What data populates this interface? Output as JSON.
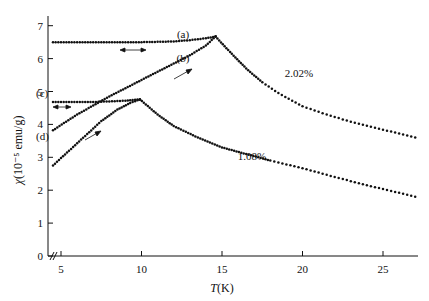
{
  "chart_data": {
    "type": "scatter",
    "title": "",
    "xlabel": "T(K)",
    "ylabel": "χ(10⁻⁵ emu/g)",
    "xlim": [
      4.0,
      27.2
    ],
    "ylim": [
      0,
      7.4
    ],
    "x_ticks": [
      5,
      10,
      15,
      20,
      25
    ],
    "y_ticks": [
      0,
      1,
      2,
      3,
      4,
      5,
      6,
      7
    ],
    "x_axis_break": true,
    "grid": false,
    "legend": "none (inline labels)",
    "series": [
      {
        "name": "(a)",
        "concentration": "2.02%",
        "description": "field-cooled, flat",
        "x": [
          4.5,
          6,
          8,
          10,
          12,
          13,
          14,
          14.6
        ],
        "y": [
          6.5,
          6.5,
          6.5,
          6.5,
          6.52,
          6.56,
          6.62,
          6.67
        ]
      },
      {
        "name": "(b)",
        "concentration": "2.02%",
        "description": "zero-field-cooled, warming",
        "x": [
          4.5,
          6,
          8,
          10,
          12,
          13,
          14,
          14.6
        ],
        "y": [
          3.82,
          4.3,
          4.85,
          5.35,
          5.85,
          6.1,
          6.4,
          6.67
        ]
      },
      {
        "name": "2.02% (above Tf)",
        "x": [
          14.6,
          15.5,
          16.5,
          17.5,
          18.5,
          20,
          21.5,
          23,
          24.5,
          26,
          27
        ],
        "y": [
          6.67,
          6.2,
          5.7,
          5.28,
          4.95,
          4.55,
          4.3,
          4.08,
          3.9,
          3.72,
          3.6
        ]
      },
      {
        "name": "(c)",
        "concentration": "1.08%",
        "description": "field-cooled, flat",
        "x": [
          4.5,
          6,
          7,
          8,
          9,
          9.9
        ],
        "y": [
          4.68,
          4.68,
          4.68,
          4.7,
          4.72,
          4.76
        ]
      },
      {
        "name": "(d)",
        "concentration": "1.08%",
        "description": "zero-field-cooled, warming",
        "x": [
          4.5,
          5.5,
          6.5,
          7.5,
          8.5,
          9.3,
          9.9
        ],
        "y": [
          2.75,
          3.2,
          3.65,
          4.1,
          4.45,
          4.65,
          4.76
        ]
      },
      {
        "name": "1.08% (above Tf)",
        "x": [
          9.9,
          11,
          12,
          13.5,
          15,
          16.5,
          18,
          20,
          22,
          24,
          26,
          27
        ],
        "y": [
          4.76,
          4.3,
          3.95,
          3.6,
          3.3,
          3.1,
          2.9,
          2.67,
          2.4,
          2.15,
          1.92,
          1.8
        ]
      }
    ],
    "annotations": [
      {
        "text": "(a)",
        "x": 12.6,
        "y": 6.75
      },
      {
        "text": "(b)",
        "x": 12.6,
        "y": 6.05
      },
      {
        "text": "(c)",
        "x": 4.4,
        "y": 4.95
      },
      {
        "text": "(d)",
        "x": 4.4,
        "y": 3.6
      },
      {
        "text": "2.02%",
        "x": 19.2,
        "y": 5.05
      },
      {
        "text": "1.08%",
        "x": 16.3,
        "y": 3.2
      },
      {
        "text": "↔ arrow (reversible)",
        "x": 8.8,
        "y": 6.2
      },
      {
        "text": "↔ arrow (reversible)",
        "x": 5.6,
        "y": 4.5
      },
      {
        "text": "→ arrow (warming)",
        "x": 12.6,
        "y": 5.3
      },
      {
        "text": "→ arrow (warming)",
        "x": 7.0,
        "y": 3.75
      }
    ]
  },
  "axes": {
    "x_label_italic": "T",
    "x_label_rest": "(K)",
    "y_label_italic": "χ",
    "y_label_rest": "(10⁻⁵ emu/g)",
    "x_tick_labels": [
      "5",
      "10",
      "15",
      "20",
      "25"
    ],
    "y_tick_labels": [
      "0",
      "1",
      "2",
      "3",
      "4",
      "5",
      "6",
      "7"
    ]
  },
  "labels": {
    "a": "(a)",
    "b": "(b)",
    "c": "(c)",
    "d": "(d)",
    "conc_high": "2.02%",
    "conc_low": "1.08%"
  },
  "colors": {
    "ink": "#111111",
    "background": "#ffffff"
  }
}
